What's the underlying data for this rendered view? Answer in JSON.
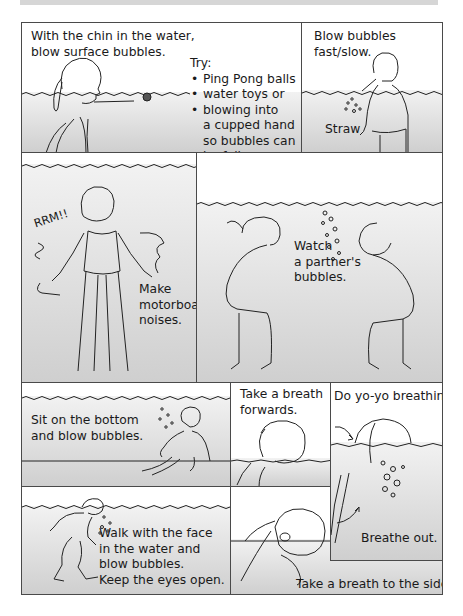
{
  "page": {
    "type": "illustrated instruction sheet",
    "topic": "underwater breathing / bubble-blowing exercises",
    "colors": {
      "border": "#4a4a4a",
      "water_light": "#f2f2f2",
      "water_dark": "#cdcdcd",
      "text": "#1a1a1a"
    }
  },
  "panels": [
    {
      "id": "surface-bubbles",
      "caption": [
        "With the chin in the water,",
        "blow surface bubbles."
      ],
      "try_heading": "Try:",
      "try_items": [
        {
          "lines": [
            "Ping Pong balls"
          ]
        },
        {
          "lines": [
            "water toys or"
          ]
        },
        {
          "lines": [
            "blowing into",
            "a cupped hand",
            "so bubbles can",
            "be felt."
          ]
        }
      ]
    },
    {
      "id": "straw",
      "caption": [
        "Blow bubbles",
        "fast/slow."
      ],
      "label": "Straw"
    },
    {
      "id": "motorboat",
      "sound": "RRM!!",
      "caption": [
        "Make",
        "motorboat",
        "noises."
      ]
    },
    {
      "id": "partner",
      "caption": [
        "Watch",
        "a partner's",
        "bubbles."
      ]
    },
    {
      "id": "sit-bottom",
      "caption": [
        "Sit on the bottom",
        "and blow bubbles."
      ]
    },
    {
      "id": "breath-forwards",
      "caption": [
        "Take a breath",
        "forwards."
      ]
    },
    {
      "id": "yoyo",
      "caption": [
        "Do yo-yo breathing."
      ],
      "label": "Breathe out."
    },
    {
      "id": "walk-face",
      "caption": [
        "Walk with the face",
        "in the water and",
        "blow bubbles.",
        "Keep the eyes open."
      ]
    },
    {
      "id": "breath-side",
      "caption": [
        "Take a breath to the side."
      ]
    }
  ]
}
